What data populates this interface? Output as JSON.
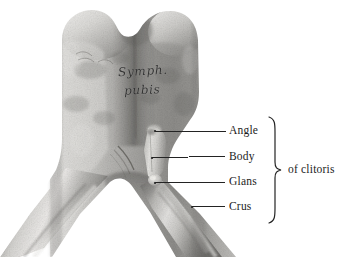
{
  "figure": {
    "medium": "halftone-photograph",
    "background_color": "#ffffff",
    "ink_color": "#1c1c1c"
  },
  "specimen_caption": {
    "line1": "Symph.",
    "line2": "pubis"
  },
  "labels": [
    {
      "id": "angle",
      "text": "Angle"
    },
    {
      "id": "body",
      "text": "Body"
    },
    {
      "id": "glans",
      "text": "Glans"
    },
    {
      "id": "crus",
      "text": "Crus"
    }
  ],
  "group_label": {
    "text": "of clitoris"
  },
  "leaders": [
    {
      "id": "angle",
      "from_x": 155,
      "from_y": 131,
      "to_x": 226,
      "to_y": 131
    },
    {
      "id": "body",
      "from_x": 152,
      "from_y": 157,
      "to_x": 226,
      "to_y": 157
    },
    {
      "id": "glans",
      "from_x": 155,
      "from_y": 182,
      "to_x": 226,
      "to_y": 182
    },
    {
      "id": "crus",
      "from_x": 192,
      "from_y": 206,
      "to_x": 226,
      "to_y": 206
    }
  ]
}
